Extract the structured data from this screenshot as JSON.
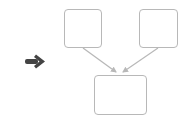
{
  "diagram": {
    "type": "merge-flow",
    "colors": {
      "node_border": "#b8b8b8",
      "edge": "#b8b8b8",
      "pointer_arrow": "#444444",
      "background": "#ffffff"
    },
    "pointer": {
      "icon": "right-arrow-icon",
      "direction": "right"
    },
    "nodes": [
      {
        "id": "top-left",
        "label": ""
      },
      {
        "id": "top-right",
        "label": ""
      },
      {
        "id": "bottom",
        "label": ""
      }
    ],
    "edges": [
      {
        "from": "top-left",
        "to": "bottom"
      },
      {
        "from": "top-right",
        "to": "bottom"
      }
    ]
  }
}
